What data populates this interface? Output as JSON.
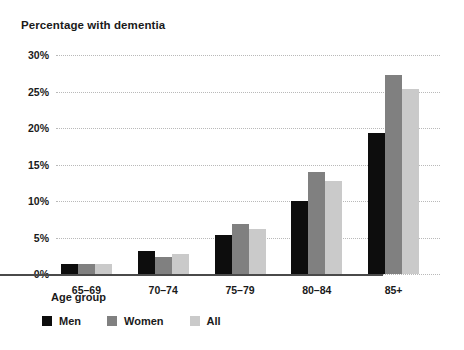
{
  "chart_data": {
    "type": "bar",
    "title": "Percentage with dementia",
    "xlabel": "Age group",
    "ylabel": "",
    "categories": [
      "65–69",
      "70–74",
      "75–79",
      "80–84",
      "85+"
    ],
    "series": [
      {
        "name": "Men",
        "color": "#0d0d0d",
        "values": [
          1.4,
          3.2,
          5.4,
          10.0,
          19.3
        ]
      },
      {
        "name": "Women",
        "color": "#808080",
        "values": [
          1.4,
          2.3,
          6.8,
          14.0,
          27.3
        ]
      },
      {
        "name": "All",
        "color": "#cacaca",
        "values": [
          1.4,
          2.7,
          6.1,
          12.8,
          25.3
        ]
      }
    ],
    "ylim": [
      0,
      30
    ],
    "ytick_labels": [
      "0%",
      "5%",
      "10%",
      "15%",
      "20%",
      "25%",
      "30%"
    ],
    "ytick_values": [
      0,
      5,
      10,
      15,
      20,
      25,
      30
    ],
    "grid": true,
    "legend_position": "bottom-left"
  },
  "legend": {
    "items": [
      {
        "label": "Men",
        "color": "#0d0d0d"
      },
      {
        "label": "Women",
        "color": "#808080"
      },
      {
        "label": "All",
        "color": "#cacaca"
      }
    ]
  },
  "colors": {
    "background": "#ffffff",
    "text": "#1a1a1a",
    "gridline": "#b9b9b9",
    "axis": "#4a4a4a"
  }
}
